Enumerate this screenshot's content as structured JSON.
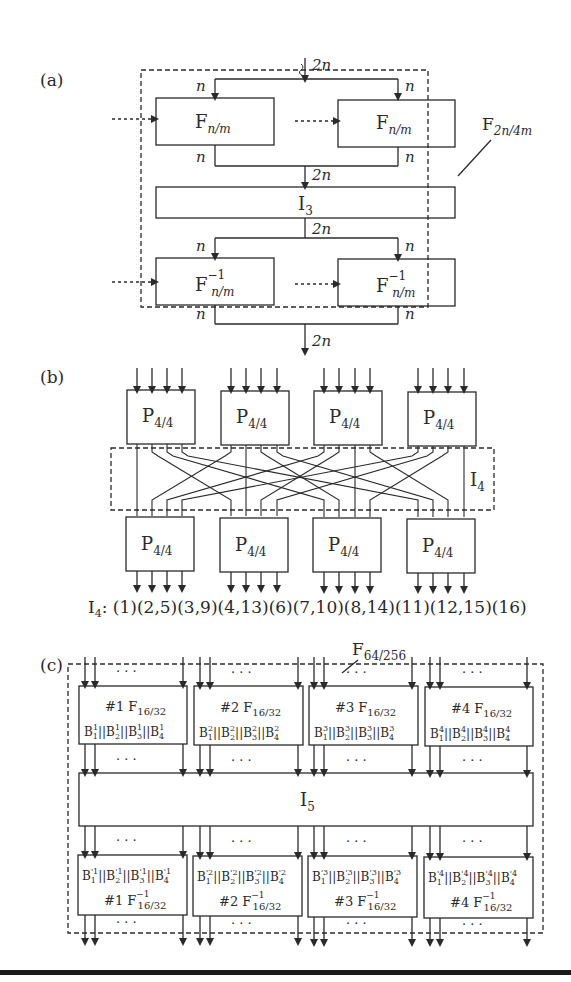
{
  "figure": {
    "panel_a": {
      "label": "(a)",
      "input_width": "2n",
      "branch_width": "n",
      "top_blocks": [
        "F",
        "F"
      ],
      "top_block_sub": "n/m",
      "interleaver": "I",
      "interleaver_sub": "3",
      "bottom_block_sup": "−1",
      "outer_label": "F",
      "outer_label_sub": "2n/4m",
      "output_width": "2n"
    },
    "panel_b": {
      "label": "(b)",
      "block": "P",
      "block_sub": "4/4",
      "interleaver": "I",
      "interleaver_sub": "4",
      "permutation_prefix": "I",
      "permutation_prefix_sub": "4",
      "permutation_text": ": (1)(2,5)(3,9)(4,13)(6)(7,10)(8,14)(11)(12,15)(16)"
    },
    "panel_c": {
      "label": "(c)",
      "outer_label": "F",
      "outer_label_sub": "64/256",
      "dots": "· · ·",
      "interleaver": "I",
      "interleaver_sub": "5",
      "top_blocks": [
        {
          "title": "#1 F",
          "sub": "16/32",
          "sup_idx": "1"
        },
        {
          "title": "#2 F",
          "sub": "16/32",
          "sup_idx": "2"
        },
        {
          "title": "#3 F",
          "sub": "16/32",
          "sup_idx": "3"
        },
        {
          "title": "#4 F",
          "sub": "16/32",
          "sup_idx": "4"
        }
      ],
      "bottom_blocks": [
        {
          "title": "#1 F",
          "sub": "16/32",
          "sup": "−1",
          "sup_idx": "'1"
        },
        {
          "title": "#2 F",
          "sub": "16/32",
          "sup": "−1",
          "sup_idx": "'2"
        },
        {
          "title": "#3 F",
          "sub": "16/32",
          "sup": "−1",
          "sup_idx": "'3"
        },
        {
          "title": "#4 F",
          "sub": "16/32",
          "sup": "−1",
          "sup_idx": "'4"
        }
      ]
    }
  }
}
